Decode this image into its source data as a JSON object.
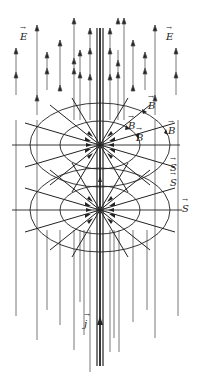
{
  "diagram": {
    "labels": {
      "E_left": "E",
      "E_right": "E",
      "B_1": "B",
      "B_2": "B",
      "B_3": "B",
      "B_4": "B",
      "S_1": "S",
      "S_2": "S",
      "S_3": "S",
      "j": "j"
    },
    "colors": {
      "line": "#222222",
      "field_line": "#555555",
      "background": "#ffffff"
    }
  }
}
